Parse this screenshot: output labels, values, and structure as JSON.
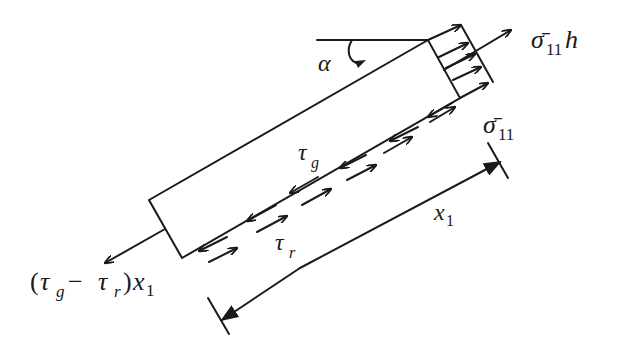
{
  "diagram": {
    "type": "free-body diagram of inclined fiber/strip segment",
    "labels": {
      "angle": "α",
      "force_right_sigma": "σ̄",
      "force_right_sub": "11",
      "force_right_suffix": "h",
      "stress_sigma": "σ̄",
      "stress_sub": "11",
      "tau_g": "τ",
      "tau_g_sub": "g",
      "tau_r": "τ",
      "tau_r_sub": "r",
      "length": "x",
      "length_sub": "1",
      "left_force_open": "(",
      "left_force_tau1": "τ",
      "left_force_sub1": "g",
      "left_force_minus": " − ",
      "left_force_tau2": "τ",
      "left_force_sub2": "r",
      "left_force_close": ")",
      "left_force_x": "x",
      "left_force_xsub": "1"
    },
    "elements": [
      "inclined rectangular element",
      "horizontal reference line with angle α arc",
      "distributed normal stress arrows on right face",
      "resultant tensile force arrow right (σ̄11 h)",
      "resultant force arrow left ((τg − τr) x1)",
      "paired shear stress arrows along bottom interface (τg above, τr below)",
      "dimension line x1 with arrowheads and end ticks"
    ],
    "colors": {
      "stroke": "#1a1a1a",
      "background": "#ffffff"
    }
  }
}
